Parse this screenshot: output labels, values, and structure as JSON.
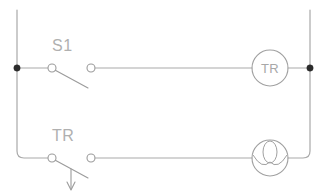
{
  "diagram": {
    "background_color": "#ffffff",
    "line_color": "#a9a9a9",
    "label_color": "#b0b0b0",
    "junction_color": "#2b2b2b",
    "labels": {
      "switch_s1": "S1",
      "contact_tr": "TR",
      "coil_tr": "TR"
    },
    "rungs": [
      {
        "name": "top-rung",
        "label": "S1",
        "contact_type": "normally-open-switch",
        "device": "TR",
        "device_type": "relay-coil"
      },
      {
        "name": "bottom-rung",
        "label": "TR",
        "contact_type": "normally-open-timed-contact",
        "device": "",
        "device_type": "lamp"
      }
    ]
  }
}
